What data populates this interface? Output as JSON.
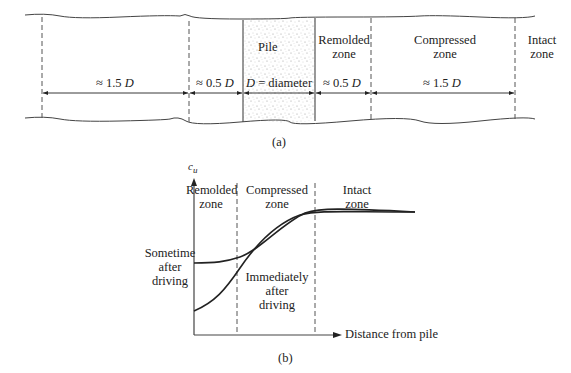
{
  "figure_a": {
    "caption": "(a)",
    "pile_label": "Pile",
    "zones": [
      {
        "name": "Remolded zone",
        "line1": "Remolded",
        "line2": "zone"
      },
      {
        "name": "Compressed zone",
        "line1": "Compressed",
        "line2": "zone"
      },
      {
        "name": "Intact zone",
        "line1": "Intact",
        "line2": "zone"
      }
    ],
    "dimensions": [
      {
        "id": "left_outer",
        "prefix": "≈ 1.5 ",
        "var": "D"
      },
      {
        "id": "left_inner",
        "prefix": "≈ 0.5 ",
        "var": "D"
      },
      {
        "id": "pile",
        "var": "D",
        "suffix": " = diameter"
      },
      {
        "id": "right_inner",
        "prefix": "≈ 0.5 ",
        "var": "D"
      },
      {
        "id": "right_outer",
        "prefix": "≈ 1.5 ",
        "var": "D"
      }
    ]
  },
  "figure_b": {
    "caption": "(b)",
    "y_axis_label": "c",
    "y_axis_subscript": "u",
    "x_axis_label": "Distance from pile",
    "zones": [
      {
        "line1": "Remolded",
        "line2": "zone"
      },
      {
        "line1": "Compressed",
        "line2": "zone"
      },
      {
        "line1": "Intact",
        "line2": "zone"
      }
    ],
    "curves": [
      {
        "line1": "Sometime",
        "line2": "after",
        "line3": "driving"
      },
      {
        "line1": "Immediately",
        "line2": "after",
        "line3": "driving"
      }
    ]
  }
}
